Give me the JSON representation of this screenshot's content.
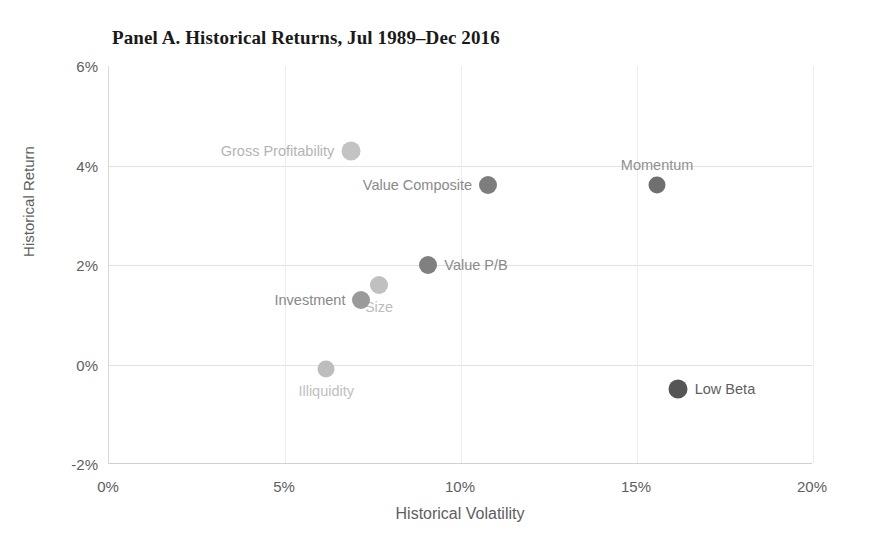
{
  "chart_data": {
    "type": "scatter",
    "title": "Panel A. Historical Returns, Jul 1989–Dec 2016",
    "xlabel": "Historical Volatility",
    "ylabel": "Historical Return",
    "xlim": [
      0,
      20
    ],
    "ylim": [
      -2,
      6
    ],
    "xticks": [
      "0%",
      "5%",
      "10%",
      "15%",
      "20%"
    ],
    "xtick_values": [
      0,
      5,
      10,
      15,
      20
    ],
    "yticks": [
      "6%",
      "4%",
      "2%",
      "0%",
      "-2%"
    ],
    "ytick_values": [
      6,
      4,
      2,
      0,
      -2
    ],
    "grid": "both",
    "legend": "none",
    "points": [
      {
        "label": "Gross Profitability",
        "x": 6.9,
        "y": 4.3,
        "color": "#c3c3c3",
        "size": 19,
        "label_side": "left"
      },
      {
        "label": "Value Composite",
        "x": 10.8,
        "y": 3.6,
        "color": "#7d7d7d",
        "size": 18,
        "label_side": "left"
      },
      {
        "label": "Momentum",
        "x": 15.6,
        "y": 3.6,
        "color": "#6f6f6f",
        "size": 17,
        "label_side": "above"
      },
      {
        "label": "Value P/B",
        "x": 9.1,
        "y": 2.0,
        "color": "#808080",
        "size": 18,
        "label_side": "right"
      },
      {
        "label": "Size",
        "x": 7.7,
        "y": 1.6,
        "color": "#c0c0c0",
        "size": 18,
        "label_side": "below"
      },
      {
        "label": "Investment",
        "x": 7.2,
        "y": 1.3,
        "color": "#9a9a9a",
        "size": 18,
        "label_side": "left"
      },
      {
        "label": "Illiquidity",
        "x": 6.2,
        "y": -0.1,
        "color": "#bdbdbd",
        "size": 17,
        "label_side": "below"
      },
      {
        "label": "Low Beta",
        "x": 16.2,
        "y": -0.5,
        "color": "#555555",
        "size": 19,
        "label_side": "right"
      }
    ],
    "label_colors": {
      "Gross Profitability": "#b4b4b4",
      "Value Composite": "#8a8a8a",
      "Momentum": "#909090",
      "Value P/B": "#8a8a8a",
      "Size": "#bcbcbc",
      "Investment": "#888888",
      "Illiquidity": "#c0c0c0",
      "Low Beta": "#5e5e5e"
    }
  }
}
